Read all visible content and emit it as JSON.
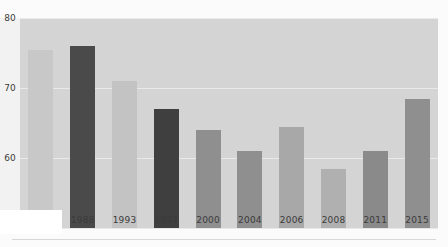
{
  "chart_data": {
    "type": "bar",
    "title": "",
    "xlabel": "",
    "ylabel": "Percentage of Turnout",
    "categories": [
      "1984",
      "1988",
      "1993",
      "1997",
      "2000",
      "2004",
      "2006",
      "2008",
      "2011",
      "2015"
    ],
    "values": [
      75.5,
      76.0,
      71.0,
      67.0,
      64.0,
      61.0,
      64.5,
      58.5,
      61.0,
      68.5
    ],
    "bar_colors": [
      "#c8c8c8",
      "#4a4a4a",
      "#c3c3c3",
      "#3f3f3f",
      "#8f8f8f",
      "#8f8f8f",
      "#a8a8a8",
      "#b0b0b0",
      "#8a8a8a",
      "#8f8f8f"
    ],
    "ylim": [
      50,
      80
    ],
    "yticks": [
      50,
      60,
      70,
      80
    ],
    "ytick_labels": [
      "50",
      "60",
      "70",
      "80"
    ],
    "grid": true,
    "legend": "none",
    "plot_background": "#d4d4d4",
    "gridline_color": "#e9e9e9",
    "text_color": "#3b3b3b"
  }
}
